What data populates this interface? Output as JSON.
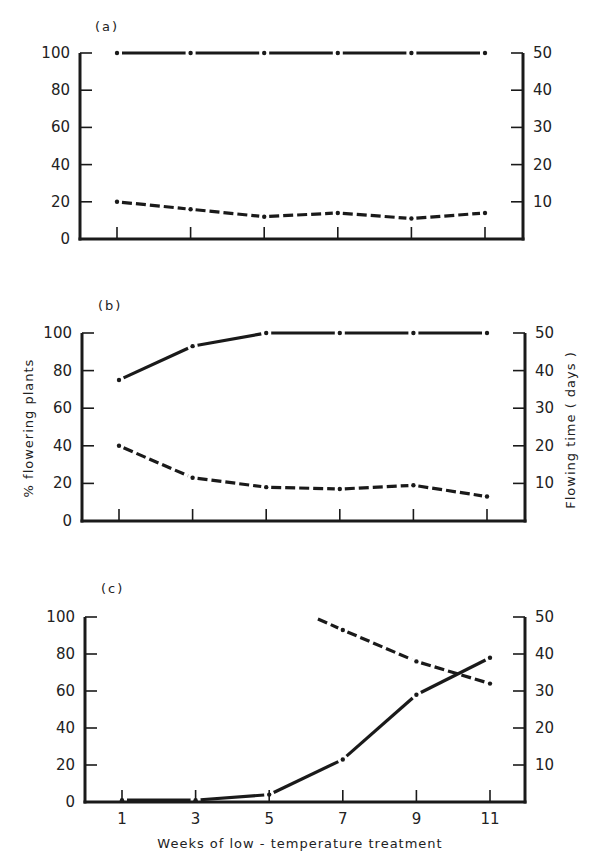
{
  "chart_data": [
    {
      "type": "line",
      "panel": "(a)",
      "categories": [
        1,
        3,
        5,
        7,
        9,
        11
      ],
      "series": [
        {
          "name": "% flowering plants",
          "axis": "left",
          "style": "solid",
          "values": [
            100,
            100,
            100,
            100,
            100,
            100
          ]
        },
        {
          "name": "Flowing time (days)",
          "axis": "right",
          "style": "dashed",
          "values": [
            10,
            8,
            6,
            7,
            5.5,
            7
          ]
        }
      ],
      "left_ylim": [
        0,
        100
      ],
      "right_ylim": [
        0,
        50
      ],
      "left_ticks": [
        0,
        20,
        40,
        60,
        80,
        100
      ],
      "right_ticks": [
        10,
        20,
        30,
        40,
        50
      ]
    },
    {
      "type": "line",
      "panel": "(b)",
      "categories": [
        1,
        3,
        5,
        7,
        9,
        11
      ],
      "series": [
        {
          "name": "% flowering plants",
          "axis": "left",
          "style": "solid",
          "values": [
            75,
            93,
            100,
            100,
            100,
            100
          ]
        },
        {
          "name": "Flowing time (days)",
          "axis": "right",
          "style": "dashed",
          "values": [
            20,
            11.5,
            9,
            8.5,
            9.5,
            6.5
          ]
        }
      ],
      "left_ylim": [
        0,
        100
      ],
      "right_ylim": [
        0,
        50
      ],
      "left_ticks": [
        0,
        20,
        40,
        60,
        80,
        100
      ],
      "right_ticks": [
        10,
        20,
        30,
        40,
        50
      ],
      "ylabel": "% flowering plants",
      "ylabel_right": "Flowing time ( days )"
    },
    {
      "type": "line",
      "panel": "(c)",
      "categories": [
        1,
        3,
        5,
        7,
        9,
        11
      ],
      "series": [
        {
          "name": "% flowering plants",
          "axis": "left",
          "style": "solid",
          "values": [
            1,
            1,
            4,
            23,
            58,
            78
          ]
        },
        {
          "name": "Flowing time (days)",
          "axis": "right",
          "style": "dashed",
          "x": [
            6.2,
            7,
            9,
            11
          ],
          "values": [
            50,
            46.5,
            38,
            32
          ]
        }
      ],
      "left_ylim": [
        0,
        100
      ],
      "right_ylim": [
        0,
        50
      ],
      "left_ticks": [
        0,
        20,
        40,
        60,
        80,
        100
      ],
      "right_ticks": [
        10,
        20,
        30,
        40,
        50
      ],
      "xlabel": "Weeks of low - temperature treatment",
      "x_tick_labels": [
        "1",
        "3",
        "5",
        "7",
        "9",
        "11"
      ]
    }
  ],
  "panels": [
    {
      "label": "(a)"
    },
    {
      "label": "(b)"
    },
    {
      "label": "(c)"
    }
  ],
  "axes": {
    "left_ticks": [
      "0",
      "20",
      "40",
      "60",
      "80",
      "100"
    ],
    "right_ticks": [
      "10",
      "20",
      "30",
      "40",
      "50"
    ],
    "x_ticks": [
      "1",
      "3",
      "5",
      "7",
      "9",
      "11"
    ],
    "ylabel_left": "% flowering plants",
    "ylabel_right": "Flowing time ( days )",
    "xlabel": "Weeks of low - temperature treatment"
  },
  "colors": {
    "ink": "#1a1a1a",
    "background": "#ffffff"
  }
}
